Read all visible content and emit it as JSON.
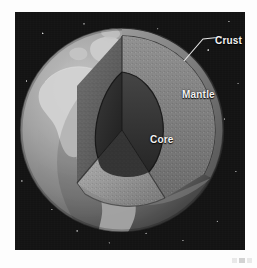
{
  "figure": {
    "background_color": "#ffffff",
    "space_color": "#121212"
  },
  "diagram": {
    "labels": [
      {
        "id": "crust",
        "text": "Crust",
        "has_leader_line": true,
        "color": "#f2f2f2"
      },
      {
        "id": "mantle",
        "text": "Mantle",
        "has_leader_line": false,
        "color": "#f2f2f2"
      },
      {
        "id": "core",
        "text": "Core",
        "has_leader_line": false,
        "color": "#f2f2f2"
      }
    ],
    "layers": [
      {
        "name": "Crust",
        "fill": "#6d6d6d",
        "description": "thin outer shell"
      },
      {
        "name": "Mantle",
        "fill": "#8a8a8a",
        "description": "stippled middle layer"
      },
      {
        "name": "Core",
        "fill": "#2b2b2b",
        "description": "dark inner sphere wedge"
      }
    ],
    "surface": {
      "ocean_color": "#8d8d8d",
      "land_color": "#cfcfcf",
      "visible_landmasses": "North America, South America, Greenland"
    }
  }
}
